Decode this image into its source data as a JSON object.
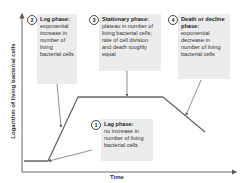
{
  "axes": {
    "y_label": "Logarithm of living bacterial cells",
    "x_label": "Time"
  },
  "phases": [
    {
      "number": "1",
      "title": "Lag phase:",
      "body": "no increase in number of living bacterial cells"
    },
    {
      "number": "2",
      "title": "Log phase:",
      "body": "exponential increase in number of living bacterial cells"
    },
    {
      "number": "3",
      "title": "Stationary phase:",
      "body": "plateau in number of living bacterial cells; rate of cell division and death roughly equal"
    },
    {
      "number": "4",
      "title": "Death or decline phase:",
      "body": "exponential decrease in number of living bacterial cells"
    }
  ],
  "colors": {
    "line": "#555555",
    "box_bg": "#ececec",
    "text": "#333333"
  }
}
